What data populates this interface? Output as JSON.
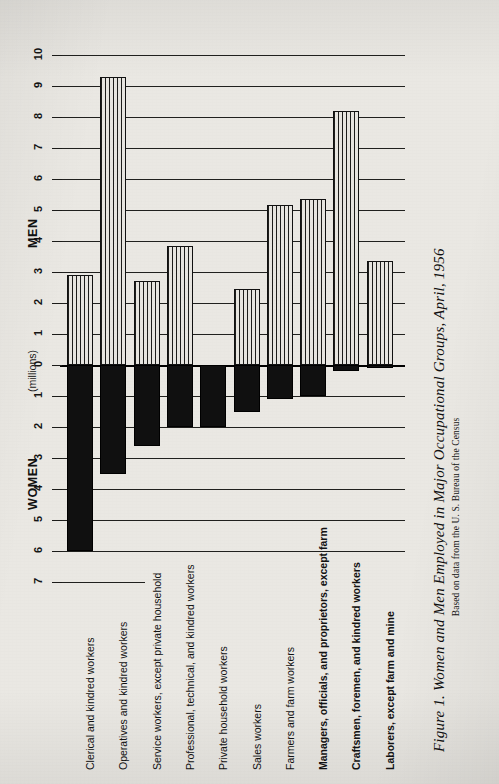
{
  "figure": {
    "caption_title": "Figure 1. Women and Men Employed in Major Occupational Groups, April, 1956",
    "caption_source": "Based on data from the U. S. Bureau of the Census",
    "men_label": "MEN",
    "women_label": "WOMEN",
    "units_label": "(millions)"
  },
  "chart_data": {
    "type": "bar",
    "title": "Figure 1. Women and Men Employed in Major Occupational Groups, April, 1956",
    "subtitle": "Based on data from the U. S. Bureau of the Census",
    "orientation": "diverging-vertical",
    "xlabel": "",
    "ylabel": "(millions)",
    "grid": true,
    "legend_position": "axis-ends",
    "categories": [
      "Clerical and kindred workers",
      "Operatives and kindred workers",
      "Service workers, except private household",
      "Professional, technical, and kindred workers",
      "Private household workers",
      "Sales workers",
      "Farmers and farm workers",
      "Managers, officials, and proprietors, except farm",
      "Craftsmen, foremen, and kindred workers",
      "Laborers, except farm and mine"
    ],
    "categories_bold": [
      false,
      false,
      false,
      false,
      false,
      false,
      false,
      true,
      true,
      true
    ],
    "series": [
      {
        "name": "MEN",
        "direction": "up",
        "fill": "vertical-hatch",
        "axis_max": 10,
        "values": [
          2.9,
          9.3,
          2.7,
          3.85,
          0.0,
          2.45,
          5.15,
          5.35,
          8.2,
          3.35
        ]
      },
      {
        "name": "WOMEN",
        "direction": "down",
        "fill": "solid-black",
        "axis_max": 7,
        "values": [
          6.0,
          3.5,
          2.6,
          2.0,
          2.0,
          1.5,
          1.1,
          1.0,
          0.2,
          0.1
        ]
      }
    ],
    "men_ticks": [
      0,
      1,
      2,
      3,
      4,
      5,
      6,
      7,
      8,
      9,
      10
    ],
    "women_ticks": [
      0,
      1,
      2,
      3,
      4,
      5,
      6,
      7
    ],
    "ylim_men": [
      0,
      10
    ],
    "ylim_women": [
      0,
      7
    ]
  },
  "colors": {
    "paper": "#eae8e3",
    "ink": "#111111",
    "men_bar": "#cfcdc8",
    "women_bar": "#101010"
  }
}
